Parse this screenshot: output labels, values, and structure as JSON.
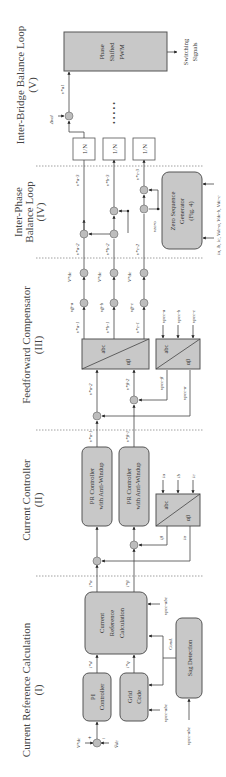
{
  "sections": [
    {
      "title": "Current Reference Calculation",
      "num": "(I)"
    },
    {
      "title": "Current Controller",
      "num": "(II)"
    },
    {
      "title": "Feedforward Compensator",
      "num": "(III)"
    },
    {
      "title": "Inter-Phase",
      "title2": "Balance Loop",
      "num": "(IV)"
    },
    {
      "title": "Inter-Bridge Balance Loop",
      "num": "(V)"
    }
  ],
  "blocks": {
    "pi_controller": [
      "PI",
      "Controller"
    ],
    "grid_code": [
      "Grid",
      "Code"
    ],
    "current_ref_calc": [
      "Current",
      "Reference",
      "Calculation"
    ],
    "sag_detection": "Sag Detection",
    "pr_alpha": [
      "PR Controller",
      "with Anti-Windup"
    ],
    "pr_beta": [
      "PR Controller",
      "with Anti-Windup"
    ],
    "abc_ab_current": {
      "top": "abc",
      "bottom": "αβ"
    },
    "ab_abc_voltage": {
      "top": "abc",
      "bottom": "αβ"
    },
    "abc_ab_pcc": {
      "top": "abc",
      "bottom": "αβ"
    },
    "zero_seq": [
      "Zero Sequence",
      "Generator",
      "(Fig. 4)"
    ],
    "divider": "1/N",
    "pwm": [
      "Phase",
      "Shifted",
      "PWM"
    ],
    "switching": [
      "Switching",
      "Signals"
    ]
  },
  "signals": {
    "vdc_ref": "V*dc",
    "vdc": "V̄dc",
    "vpcc_abc": "vpcc-abc",
    "id_ref": "i*d",
    "iq_ref": "i*q",
    "cond": "Cond.",
    "ia_ref": "i*α",
    "ib_ref": "i*β",
    "ia": "iα",
    "ib": "iβ",
    "iabc": [
      "ia",
      "ib",
      "ic"
    ],
    "va1": "v*α-1",
    "vb1": "v*β-1",
    "va2": "v*α-2",
    "vb2": "v*β-2",
    "vpcc_a": "vpcc-α",
    "vpcc_b": "vpcc-β",
    "vpcc_phases": [
      "vpcc-a",
      "vpcc-b",
      "vpcc-c"
    ],
    "v1": [
      "v*a-1",
      "v*b-1",
      "v*c-1"
    ],
    "vff": [
      "vff-a",
      "vff-b",
      "vff-c"
    ],
    "vdc_phase": [
      "V*dc",
      "V*dc",
      "V*dc"
    ],
    "v2": [
      "v*a-2",
      "v*b-2",
      "v*c-2"
    ],
    "v3": [
      "v*a-3",
      "v*b-3",
      "v*c-3"
    ],
    "vzero": "vzero",
    "zs_inputs": "ia, ib, ic, Vdc-a, Vdc-b, Vdc-c",
    "dvel": "Δvel",
    "va1_out": "v*a1",
    "dots": "• • • • •"
  },
  "signs": {
    "plus": "+",
    "minus": "−",
    "times": "×"
  }
}
